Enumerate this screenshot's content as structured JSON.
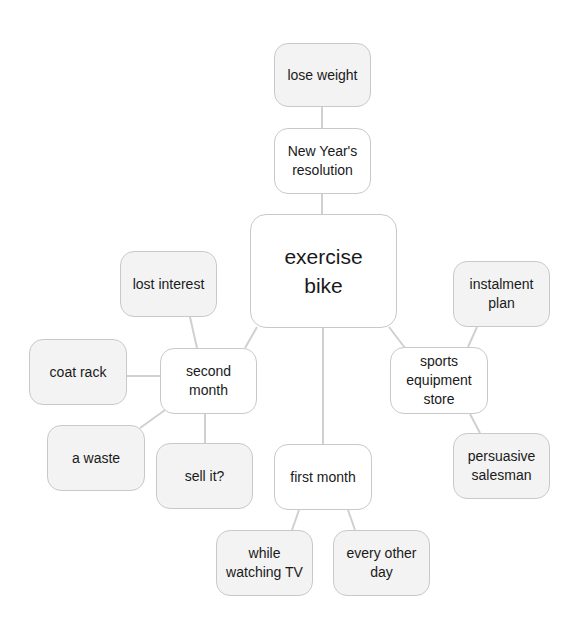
{
  "diagram": {
    "type": "mind-map",
    "colors": {
      "background": "#ffffff",
      "leaf_fill": "#f3f3f3",
      "mid_fill": "#ffffff",
      "border": "#c9c9c9",
      "edge": "#d0d0d0",
      "text": "#1a1a1a"
    },
    "nodes": [
      {
        "id": "center",
        "label": "exercise\nbike",
        "kind": "center",
        "x": 250,
        "y": 214,
        "w": 147,
        "h": 114
      },
      {
        "id": "new-years-resolution",
        "label": "New Year's\nresolution",
        "kind": "mid",
        "x": 274,
        "y": 128,
        "w": 97,
        "h": 66
      },
      {
        "id": "lose-weight",
        "label": "lose weight",
        "kind": "leaf",
        "x": 274,
        "y": 43,
        "w": 97,
        "h": 64
      },
      {
        "id": "second-month",
        "label": "second\nmonth",
        "kind": "mid",
        "x": 160,
        "y": 348,
        "w": 97,
        "h": 66
      },
      {
        "id": "lost-interest",
        "label": "lost interest",
        "kind": "leaf",
        "x": 120,
        "y": 251,
        "w": 97,
        "h": 66
      },
      {
        "id": "coat-rack",
        "label": "coat rack",
        "kind": "leaf",
        "x": 29,
        "y": 339,
        "w": 98,
        "h": 66
      },
      {
        "id": "a-waste",
        "label": "a waste",
        "kind": "leaf",
        "x": 47,
        "y": 425,
        "w": 98,
        "h": 66
      },
      {
        "id": "sell-it",
        "label": "sell it?",
        "kind": "leaf",
        "x": 156,
        "y": 443,
        "w": 97,
        "h": 66
      },
      {
        "id": "first-month",
        "label": "first month",
        "kind": "mid",
        "x": 274,
        "y": 444,
        "w": 98,
        "h": 66
      },
      {
        "id": "while-watching-tv",
        "label": "while\nwatching TV",
        "kind": "leaf",
        "x": 216,
        "y": 530,
        "w": 97,
        "h": 66
      },
      {
        "id": "every-other-day",
        "label": "every other\nday",
        "kind": "leaf",
        "x": 333,
        "y": 530,
        "w": 97,
        "h": 66
      },
      {
        "id": "sports-equipment-store",
        "label": "sports\nequipment\nstore",
        "kind": "mid",
        "x": 390,
        "y": 347,
        "w": 98,
        "h": 67
      },
      {
        "id": "instalment-plan",
        "label": "instalment\nplan",
        "kind": "leaf",
        "x": 453,
        "y": 261,
        "w": 97,
        "h": 66
      },
      {
        "id": "persuasive-salesman",
        "label": "persuasive\nsalesman",
        "kind": "leaf",
        "x": 453,
        "y": 433,
        "w": 97,
        "h": 66
      }
    ],
    "edges": [
      {
        "from": "lose-weight",
        "to": "new-years-resolution",
        "x1": 322,
        "y1": 107,
        "x2": 322,
        "y2": 128
      },
      {
        "from": "new-years-resolution",
        "to": "center",
        "x1": 322,
        "y1": 194,
        "x2": 322,
        "y2": 214
      },
      {
        "from": "center",
        "to": "second-month",
        "x1": 257,
        "y1": 327,
        "x2": 245,
        "y2": 348
      },
      {
        "from": "center",
        "to": "first-month",
        "x1": 323,
        "y1": 328,
        "x2": 323,
        "y2": 444
      },
      {
        "from": "center",
        "to": "sports-equipment-store",
        "x1": 389,
        "y1": 327,
        "x2": 405,
        "y2": 348
      },
      {
        "from": "lost-interest",
        "to": "second-month",
        "x1": 190,
        "y1": 317,
        "x2": 197,
        "y2": 348
      },
      {
        "from": "coat-rack",
        "to": "second-month",
        "x1": 127,
        "y1": 376,
        "x2": 160,
        "y2": 376
      },
      {
        "from": "a-waste",
        "to": "second-month",
        "x1": 140,
        "y1": 428,
        "x2": 165,
        "y2": 410
      },
      {
        "from": "sell-it",
        "to": "second-month",
        "x1": 205,
        "y1": 443,
        "x2": 205,
        "y2": 414
      },
      {
        "from": "first-month",
        "to": "while-watching-tv",
        "x1": 299,
        "y1": 510,
        "x2": 292,
        "y2": 530
      },
      {
        "from": "first-month",
        "to": "every-other-day",
        "x1": 348,
        "y1": 510,
        "x2": 355,
        "y2": 530
      },
      {
        "from": "instalment-plan",
        "to": "sports-equipment-store",
        "x1": 477,
        "y1": 327,
        "x2": 468,
        "y2": 347
      },
      {
        "from": "persuasive-salesman",
        "to": "sports-equipment-store",
        "x1": 480,
        "y1": 433,
        "x2": 470,
        "y2": 414
      }
    ]
  }
}
